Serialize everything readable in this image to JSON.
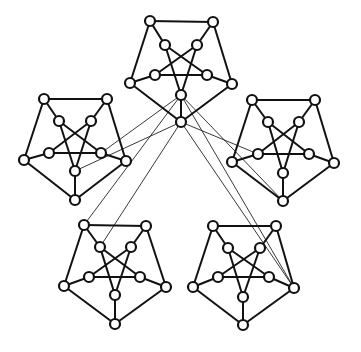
{
  "diagram": {
    "title": "",
    "node_radius": 5,
    "colors": {
      "stroke": "#111111",
      "node_fill": "#ffffff",
      "background": "#ffffff"
    },
    "subgraphs": [
      {
        "name": "top",
        "outer": [
          [
            150,
            21
          ],
          [
            213,
            22
          ],
          [
            232,
            84
          ],
          [
            181,
            122
          ],
          [
            130,
            83
          ]
        ],
        "inner": [
          [
            165,
            45
          ],
          [
            197,
            45
          ],
          [
            207,
            75
          ],
          [
            181,
            95
          ],
          [
            155,
            75
          ]
        ]
      },
      {
        "name": "left",
        "outer": [
          [
            44,
            99
          ],
          [
            107,
            99
          ],
          [
            126,
            161
          ],
          [
            75,
            200
          ],
          [
            24,
            160
          ]
        ],
        "inner": [
          [
            59,
            121
          ],
          [
            91,
            121
          ],
          [
            101,
            153
          ],
          [
            75,
            171
          ],
          [
            49,
            153
          ]
        ]
      },
      {
        "name": "right",
        "outer": [
          [
            252,
            100
          ],
          [
            315,
            100
          ],
          [
            334,
            163
          ],
          [
            283,
            201
          ],
          [
            232,
            162
          ]
        ],
        "inner": [
          [
            268,
            122
          ],
          [
            299,
            122
          ],
          [
            309,
            154
          ],
          [
            283,
            173
          ],
          [
            258,
            154
          ]
        ]
      },
      {
        "name": "bottom-left",
        "outer": [
          [
            84,
            225
          ],
          [
            146,
            226
          ],
          [
            166,
            287
          ],
          [
            115,
            324
          ],
          [
            64,
            286
          ]
        ],
        "inner": [
          [
            100,
            247
          ],
          [
            131,
            247
          ],
          [
            140,
            277
          ],
          [
            115,
            295
          ],
          [
            89,
            277
          ]
        ]
      },
      {
        "name": "bottom-right",
        "outer": [
          [
            213,
            226
          ],
          [
            276,
            226
          ],
          [
            294,
            288
          ],
          [
            243,
            325
          ],
          [
            193,
            287
          ]
        ],
        "inner": [
          [
            228,
            248
          ],
          [
            260,
            248
          ],
          [
            269,
            277
          ],
          [
            243,
            297
          ],
          [
            218,
            277
          ]
        ]
      }
    ],
    "cross_edges": [
      [
        [
          181,
          95
        ],
        [
          101,
          153
        ]
      ],
      [
        [
          181,
          122
        ],
        [
          75,
          171
        ]
      ],
      [
        [
          181,
          95
        ],
        [
          84,
          225
        ]
      ],
      [
        [
          181,
          122
        ],
        [
          100,
          247
        ]
      ],
      [
        [
          181,
          95
        ],
        [
          283,
          201
        ]
      ],
      [
        [
          181,
          122
        ],
        [
          258,
          154
        ]
      ],
      [
        [
          181,
          95
        ],
        [
          294,
          288
        ]
      ],
      [
        [
          181,
          122
        ],
        [
          294,
          288
        ]
      ]
    ]
  }
}
